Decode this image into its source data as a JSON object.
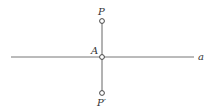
{
  "diagram": {
    "line_label": "a",
    "points": {
      "p": {
        "label": "P",
        "x": 102,
        "y": 21
      },
      "a": {
        "label": "A",
        "x": 102,
        "y": 57
      },
      "p_prime": {
        "label": "P′",
        "x": 102,
        "y": 93
      }
    },
    "line": {
      "x1": 11,
      "x2": 194,
      "y": 57
    },
    "stroke_color": "#555555"
  }
}
